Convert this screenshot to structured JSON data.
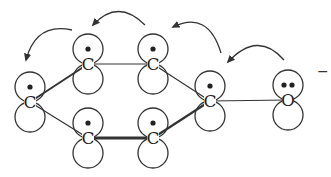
{
  "diagram": {
    "title": "",
    "colors": {
      "stroke": "#333333",
      "dot": "#222222",
      "background": "#ffffff"
    },
    "orbital_radius": 15,
    "atoms": [
      {
        "id": "c1",
        "label": "C",
        "x": 30,
        "y": 102,
        "electrons": 1,
        "position": "left"
      },
      {
        "id": "c2",
        "label": "C",
        "x": 88,
        "y": 64,
        "electrons": 1,
        "position": "top-left"
      },
      {
        "id": "c3",
        "label": "C",
        "x": 153,
        "y": 64,
        "electrons": 1,
        "position": "top-right"
      },
      {
        "id": "c4",
        "label": "C",
        "x": 210,
        "y": 101,
        "electrons": 1,
        "position": "right"
      },
      {
        "id": "c5",
        "label": "C",
        "x": 153,
        "y": 138,
        "electrons": 1,
        "position": "bottom-right"
      },
      {
        "id": "c6",
        "label": "C",
        "x": 88,
        "y": 138,
        "electrons": 1,
        "position": "bottom-left"
      },
      {
        "id": "o1",
        "label": "O",
        "x": 288,
        "y": 100,
        "electrons": 2,
        "position": "oxygen"
      }
    ],
    "charge": {
      "label": "−",
      "x": 317,
      "y": 76
    },
    "bonds": [
      {
        "from": "c1",
        "to": "c2",
        "weight": 2
      },
      {
        "from": "c2",
        "to": "c3",
        "weight": 1.2
      },
      {
        "from": "c3",
        "to": "c4",
        "weight": 1.2
      },
      {
        "from": "c1",
        "to": "c6",
        "weight": 1.2
      },
      {
        "from": "c6",
        "to": "c5",
        "weight": 3
      },
      {
        "from": "c5",
        "to": "c4",
        "weight": 2.2
      },
      {
        "from": "c4",
        "to": "o1",
        "weight": 1.2
      }
    ],
    "arrows": [
      {
        "id": "arrow-o-to-c4",
        "d": "M 284 60 Q 258 30 228 62",
        "head": [
          228,
          62
        ]
      },
      {
        "id": "arrow-c4-to-c3",
        "d": "M 221 53 Q 208 10 173 27",
        "head": [
          173,
          27
        ]
      },
      {
        "id": "arrow-c3-to-c2",
        "d": "M 145 25 Q 118 -2 93 25",
        "head": [
          93,
          25
        ]
      },
      {
        "id": "arrow-c2-to-c1",
        "d": "M 72 30 Q 36 22 26 60",
        "head": [
          26,
          60
        ]
      }
    ]
  }
}
